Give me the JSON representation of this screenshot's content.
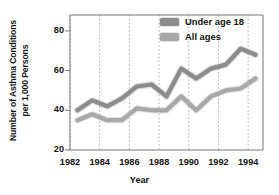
{
  "chart_data": {
    "type": "line",
    "title": "",
    "xlabel": "Year",
    "ylabel": "Number of Asthma Conditions per 1,000 Persons",
    "ylabel_line1": "Number of Asthma Conditions",
    "ylabel_line2": "per 1,000 Persons",
    "xlim": [
      1982,
      1995
    ],
    "ylim": [
      20,
      88
    ],
    "ytick_values": [
      20,
      40,
      60,
      80
    ],
    "ytick_labels": [
      "20",
      "40",
      "60",
      "80"
    ],
    "xtick_values": [
      1982,
      1984,
      1986,
      1988,
      1990,
      1992,
      1994
    ],
    "xtick_labels": [
      "1982",
      "1984",
      "1986",
      "1988",
      "1990",
      "1992",
      "1994"
    ],
    "grid": "vertical-dotted",
    "legend_position": "top-right-inside",
    "x": [
      1982.5,
      1983.5,
      1984.5,
      1985.5,
      1986.5,
      1987.5,
      1988.5,
      1989.5,
      1990.5,
      1991.5,
      1992.5,
      1993.5,
      1994.5
    ],
    "series": [
      {
        "name": "Under age 18",
        "color": "#8c8c8c",
        "values": [
          40,
          45,
          42,
          46,
          52,
          53,
          47,
          61,
          56,
          61,
          63,
          71,
          68
        ]
      },
      {
        "name": "All ages",
        "color": "#a8a8a8",
        "values": [
          35,
          38,
          35,
          35,
          41,
          40,
          40,
          47,
          40,
          47,
          50,
          51,
          56
        ]
      }
    ]
  },
  "legend": {
    "items": [
      {
        "label": "Under age 18",
        "color": "#8c8c8c"
      },
      {
        "label": "All ages",
        "color": "#a8a8a8"
      }
    ]
  },
  "axes": {
    "x_axis_title": "Year",
    "y_axis_title_line1": "Number of Asthma Conditions",
    "y_axis_title_line2": "per 1,000 Persons"
  },
  "colors": {
    "series_under18": "#8c8c8c",
    "series_allages": "#a8a8a8",
    "axis": "#777777",
    "grid": "#9a9a9a",
    "text": "#151515",
    "background": "#ffffff"
  }
}
